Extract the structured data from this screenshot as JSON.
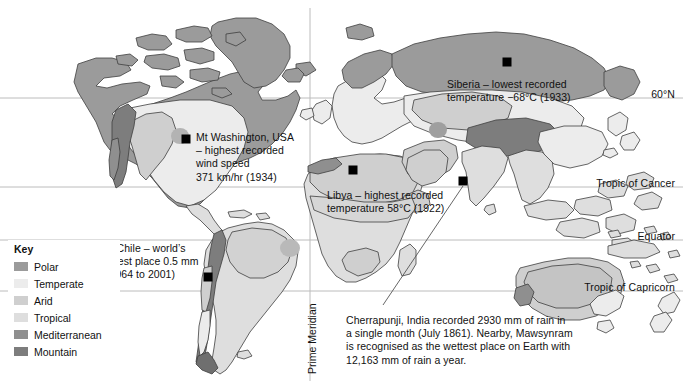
{
  "map": {
    "title_alt": "World climate zones map with weather records",
    "background": "#ffffff",
    "ocean_color": "#ffffff",
    "outline_color": "#3a3a3a",
    "grid_color": "#b9b9b9"
  },
  "climate_colors": {
    "polar": "#9b9b9b",
    "temperate": "#ececec",
    "arid": "#cfcfcf",
    "tropical": "#dedede",
    "mediterranean": "#8f8f8f",
    "mountain": "#7d7d7d"
  },
  "key": {
    "title": "Key",
    "items": [
      {
        "label": "Polar",
        "color": "#9b9b9b"
      },
      {
        "label": "Temperate",
        "color": "#ececec"
      },
      {
        "label": "Arid",
        "color": "#cfcfcf"
      },
      {
        "label": "Tropical",
        "color": "#dedede"
      },
      {
        "label": "Mediterranean",
        "color": "#8f8f8f"
      },
      {
        "label": "Mountain",
        "color": "#7d7d7d"
      }
    ]
  },
  "gridlines": {
    "latitudes": [
      {
        "id": "n60",
        "label": "60°N",
        "y": 98
      },
      {
        "id": "cancer",
        "label": "Tropic of Cancer",
        "y": 187
      },
      {
        "id": "equator",
        "label": "Equator",
        "y": 240
      },
      {
        "id": "capricorn",
        "label": "Tropic of Capricorn",
        "y": 291
      }
    ],
    "meridian": {
      "id": "prime",
      "label": "Prime Meridian",
      "x": 310
    }
  },
  "annotations": [
    {
      "id": "siberia",
      "text": "Siberia – lowest recorded\ntemperature −68°C (1933)",
      "x": 447,
      "y": 78,
      "marker_x": 507,
      "marker_y": 62
    },
    {
      "id": "mt-washington",
      "text": "Mt Washington, USA\n– highest recorded\nwind speed\n371 km/hr (1934)",
      "x": 196,
      "y": 131,
      "marker_x": 186,
      "marker_y": 139
    },
    {
      "id": "libya",
      "text": "Libya – highest recorded\ntemperature 58°C (1922)",
      "x": 327,
      "y": 189,
      "marker_x": 353,
      "marker_y": 170
    },
    {
      "id": "n-chile",
      "text": "N Chile – world’s\ndriest place 0.5 mm\n(1964 to 2001)",
      "x": 106,
      "y": 242,
      "marker_x": 208,
      "marker_y": 277
    },
    {
      "id": "cherrapunji",
      "text": "Cherrapunji, India recorded 2930 mm of rain in\na single month (July 1861). Nearby, Mawsynram\nis recognised as the wettest place on Earth with\n12,163 mm of rain a year.",
      "x": 346,
      "y": 314,
      "marker_x": 463,
      "marker_y": 181
    }
  ],
  "markers": [
    {
      "id": "marker-siberia",
      "x": 507,
      "y": 62,
      "size": 9
    },
    {
      "id": "marker-mt-washington",
      "x": 186,
      "y": 139,
      "size": 9
    },
    {
      "id": "marker-libya",
      "x": 353,
      "y": 170,
      "size": 9
    },
    {
      "id": "marker-cherrapunji",
      "x": 463,
      "y": 181,
      "size": 9
    },
    {
      "id": "marker-n-chile",
      "x": 208,
      "y": 277,
      "size": 9
    }
  ],
  "leader_line": {
    "id": "cherrapunji-leader",
    "from_x": 463,
    "from_y": 186,
    "to_x": 383,
    "to_y": 305
  }
}
